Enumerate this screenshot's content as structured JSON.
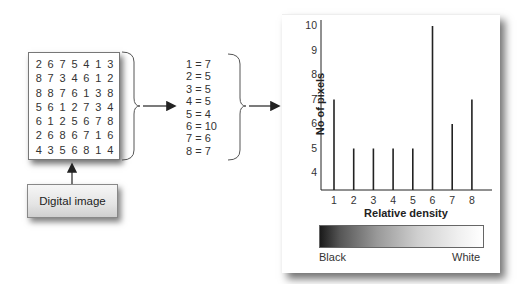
{
  "digital_image": {
    "grid": [
      [
        "2",
        "6",
        "7",
        "5",
        "4",
        "1",
        "3"
      ],
      [
        "8",
        "7",
        "3",
        "4",
        "6",
        "1",
        "2"
      ],
      [
        "8",
        "8",
        "7",
        "6",
        "1",
        "3",
        "8"
      ],
      [
        "5",
        "6",
        "1",
        "2",
        "7",
        "3",
        "4"
      ],
      [
        "6",
        "1",
        "2",
        "5",
        "6",
        "7",
        "8"
      ],
      [
        "2",
        "6",
        "8",
        "6",
        "7",
        "1",
        "6"
      ],
      [
        "4",
        "3",
        "5",
        "6",
        "8",
        "1",
        "4"
      ]
    ],
    "label": "Digital image"
  },
  "counts": {
    "items": [
      "1 = 7",
      "2 = 5",
      "3 = 5",
      "4 = 5",
      "5 = 4",
      "6 = 10",
      "7 = 6",
      "8 = 7"
    ]
  },
  "chart_data": {
    "type": "bar",
    "title": "",
    "xlabel": "Relative density",
    "ylabel": "No of pixels",
    "categories": [
      "1",
      "2",
      "3",
      "4",
      "5",
      "6",
      "7",
      "8"
    ],
    "values": [
      7,
      5,
      5,
      5,
      5,
      10,
      6,
      7
    ],
    "yticks": [
      "4",
      "5",
      "6",
      "7",
      "8",
      "9",
      "10"
    ],
    "ylim": [
      3.3,
      10
    ],
    "grid": false,
    "legend": null,
    "colorbar": {
      "left_label": "Black",
      "right_label": "White"
    }
  },
  "colors": {
    "line": "#222222",
    "panel": "#ffffff",
    "shadow": "#555555"
  }
}
